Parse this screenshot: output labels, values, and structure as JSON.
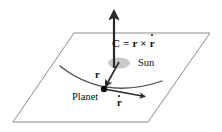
{
  "figure": {
    "type": "physics-vector-diagram",
    "background_color": "#ffffff",
    "title_text": ""
  },
  "labels": {
    "c_equation": {
      "full_text": "C = r × ṙ",
      "c_symbol": "C",
      "equals": " = ",
      "r_symbol": "r",
      "cross": " × ",
      "rdot_symbol": "r"
    },
    "sun": "Sun",
    "planet": "Planet",
    "r_vector": "r",
    "rdot_vector": "r"
  },
  "elements": {
    "plane": {
      "name": "orbital-plane",
      "shape": "parallelogram",
      "points": "74,33 210,33 148,122 13,122",
      "stroke": "#8a8a8a",
      "stroke_width": 1,
      "fill": "none"
    },
    "c_arrow": {
      "name": "angular-momentum-vector",
      "x1": 114,
      "y1": 68,
      "x2": 114,
      "y2": 10,
      "stroke": "#2a2a2a",
      "stroke_width": 2.2,
      "arrowhead": "solid-triangle"
    },
    "r_arrow": {
      "name": "position-vector",
      "x1": 118,
      "y1": 64,
      "x2": 104,
      "y2": 88,
      "stroke": "#2a2a2a",
      "stroke_width": 1.6,
      "arrowhead": "solid-triangle"
    },
    "rdot_arrow": {
      "name": "velocity-vector",
      "x1": 104,
      "y1": 89,
      "x2": 146,
      "y2": 97,
      "stroke": "#2a2a2a",
      "stroke_width": 1.4,
      "arrowhead": "solid-triangle"
    },
    "sun_body": {
      "name": "sun-ellipse",
      "cx": 119,
      "cy": 63,
      "rx": 11,
      "ry": 5.5,
      "fill": "#c9c9c9"
    },
    "planet_body": {
      "name": "planet-dot",
      "cx": 104,
      "cy": 89,
      "r": 3.2,
      "fill": "#0d0d0d"
    },
    "orbit_curve": {
      "name": "orbit-path",
      "path": "M 60,66 Q 104,100 162,81",
      "stroke": "#4a4a4a",
      "stroke_width": 1.3,
      "fill": "none"
    }
  },
  "colors": {
    "plane_stroke": "#8a8a8a",
    "vector_stroke": "#2a2a2a",
    "sun_fill": "#c9c9c9",
    "planet_fill": "#0d0d0d",
    "orbit_stroke": "#4a4a4a",
    "text": "#101010",
    "background": "#ffffff"
  }
}
